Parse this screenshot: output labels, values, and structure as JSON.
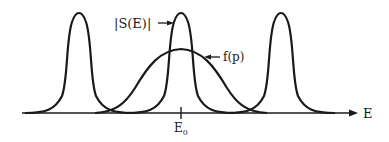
{
  "diagram": {
    "curves": [
      {
        "name": "|S(E)| peak left",
        "center_x": 79
      },
      {
        "name": "|S(E)| peak center",
        "center_x": 181
      },
      {
        "name": "|S(E)| peak right",
        "center_x": 281
      },
      {
        "name": "f(p)",
        "center_x": 181
      }
    ],
    "labels": {
      "s_of_e": "|S(E)|",
      "f_of_p": "f(p)",
      "e0_main": "E",
      "e0_sub": "0",
      "axis": "E"
    },
    "colors": {
      "stroke": "#1a1a1a",
      "background": "#ffffff"
    }
  }
}
